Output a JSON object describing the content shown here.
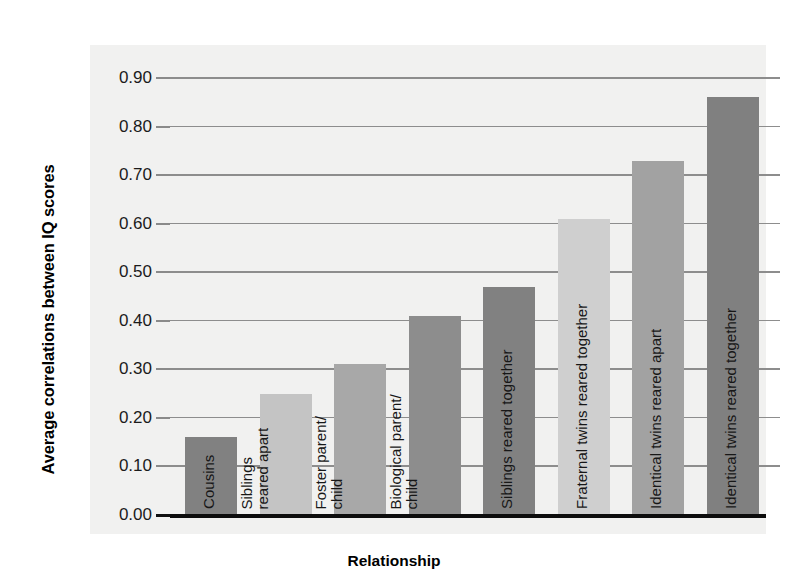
{
  "chart_data": {
    "type": "bar",
    "title": "",
    "xlabel": "Relationship",
    "ylabel": "Average correlations between IQ scores",
    "ylim": [
      0.0,
      0.9
    ],
    "grid": true,
    "legend": "none",
    "ytick_labels": [
      "0.90",
      "0.80",
      "0.70",
      "0.60",
      "0.50",
      "0.40",
      "0.30",
      "0.20",
      "0.10",
      "0.00"
    ],
    "ytick_values": [
      0.9,
      0.8,
      0.7,
      0.6,
      0.5,
      0.4,
      0.3,
      0.2,
      0.1,
      0.0
    ],
    "categories": [
      "Cousins",
      "Siblings reared apart",
      "Foster parent/child",
      "Biological parent/child",
      "Siblings reared together",
      "Fraternal twins reared together",
      "Identical twins reared apart",
      "Identical twins reared together"
    ],
    "values": [
      0.16,
      0.25,
      0.31,
      0.41,
      0.47,
      0.61,
      0.73,
      0.86
    ],
    "bar_colors": [
      "#818181",
      "#c4c4c4",
      "#a8a8a8",
      "#8d8d8d",
      "#818181",
      "#cfcfcf",
      "#a2a2a2",
      "#808080"
    ],
    "bar_label_lines": [
      [
        "Cousins"
      ],
      [
        "Siblings",
        "reared apart"
      ],
      [
        "Foster parent/",
        "child"
      ],
      [
        "Biological parent/",
        "child"
      ],
      [
        "Siblings reared together"
      ],
      [
        "Fraternal twins reared together"
      ],
      [
        "Identical twins reared apart"
      ],
      [
        "Identical twins reared together"
      ]
    ]
  },
  "colors": {
    "plot_background": "#f1f1f0",
    "gridline": "#8d8d8d",
    "baseline": "#0d0d0d",
    "text": "#171717"
  }
}
